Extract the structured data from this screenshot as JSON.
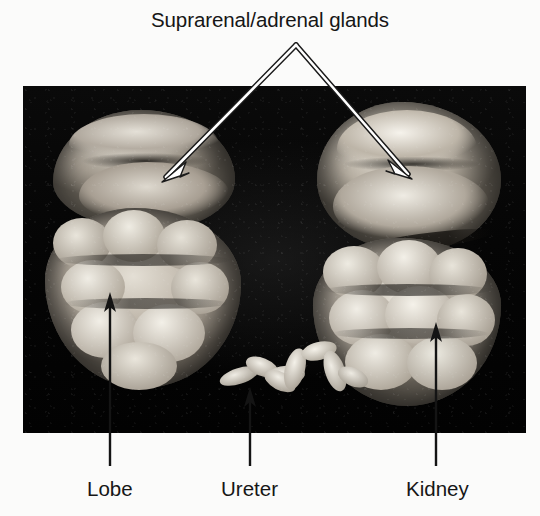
{
  "figure": {
    "type": "anatomical-photograph",
    "photo": {
      "background_color": "#070707",
      "tone": "grayscale"
    },
    "page_background": "#fbfbfa",
    "text_color": "#161616"
  },
  "title": {
    "text": "Suprarenal/adrenal glands"
  },
  "callouts": {
    "top": {
      "label": "Suprarenal/adrenal glands",
      "arrow_color": "#ffffff",
      "apex": {
        "x": 296,
        "y": 45
      },
      "targets": [
        {
          "name": "left-adrenal-gland",
          "x": 165,
          "y": 178
        },
        {
          "name": "right-adrenal-gland",
          "x": 409,
          "y": 174
        }
      ]
    },
    "bottom": [
      {
        "label": "Lobe",
        "arrow_color": "#111111",
        "line_x": 110,
        "tip_y": 294,
        "base_y": 466
      },
      {
        "label": "Ureter",
        "arrow_color": "#111111",
        "line_x": 250,
        "tip_y": 389,
        "base_y": 466
      },
      {
        "label": "Kidney",
        "arrow_color": "#111111",
        "line_x": 436,
        "tip_y": 324,
        "base_y": 466
      }
    ]
  },
  "labels": {
    "lobe": "Lobe",
    "ureter": "Ureter",
    "kidney": "Kidney"
  }
}
